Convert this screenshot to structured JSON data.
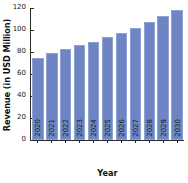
{
  "chart_data": {
    "type": "bar",
    "title": "",
    "xlabel": "Year",
    "ylabel": "Revenue (in USD Million)",
    "categories": [
      "2020",
      "2021",
      "2022",
      "2023",
      "2024",
      "2025",
      "2026",
      "2027",
      "2028",
      "2029",
      "2030"
    ],
    "values": [
      75,
      79,
      82.5,
      86,
      89.5,
      93.5,
      97.5,
      102,
      107,
      112.5,
      118
    ],
    "ylim": [
      0,
      120
    ],
    "yticks": [
      0,
      20,
      40,
      60,
      80,
      100,
      120
    ],
    "ytick_labels": [
      "0",
      "20",
      "40",
      "60",
      "80",
      "100",
      "120"
    ],
    "grid": false,
    "legend": null,
    "bar_color": "#6d85c5",
    "bar_edge_color": "#8fa2d4",
    "axis_color": "#2b2b2b",
    "background_color": "#ffffff"
  }
}
